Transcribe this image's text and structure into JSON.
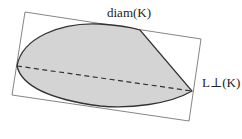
{
  "figure": {
    "labels": {
      "diameter": "diam(K)",
      "width": "L⊥(K)"
    },
    "colors": {
      "fill": "#d4d4d4",
      "outline": "#333333",
      "frame": "#666666",
      "dashed": "#333333"
    }
  }
}
